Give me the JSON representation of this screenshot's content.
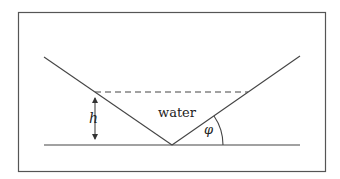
{
  "diagram": {
    "type": "V-shaped channel cross-section filled with water",
    "labels": {
      "water": "water",
      "height": "h",
      "angle": "φ"
    },
    "elements": [
      {
        "name": "outer-frame",
        "kind": "rectangle"
      },
      {
        "name": "ground-line",
        "kind": "horizontal line"
      },
      {
        "name": "left-slope",
        "kind": "line",
        "from": "upper-left",
        "to": "vertex"
      },
      {
        "name": "right-slope",
        "kind": "line",
        "from": "vertex",
        "to": "upper-right"
      },
      {
        "name": "water-surface",
        "kind": "dashed horizontal line"
      },
      {
        "name": "height-arrow",
        "kind": "double-headed vertical arrow",
        "label": "h"
      },
      {
        "name": "angle-arc",
        "kind": "arc between right slope and ground",
        "label": "φ"
      }
    ],
    "colors": {
      "stroke": "#444444",
      "frame": "#555555",
      "background": "#ffffff"
    }
  }
}
